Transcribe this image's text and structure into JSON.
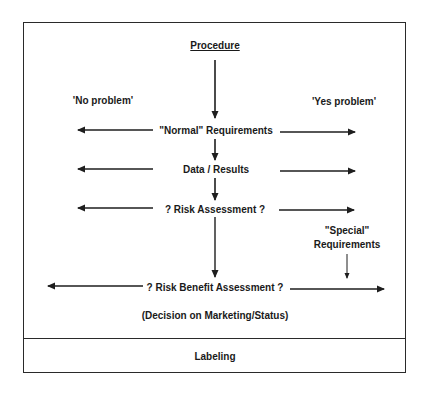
{
  "diagram": {
    "title": "Procedure",
    "side_labels": {
      "left": "'No problem'",
      "right": "'Yes problem'"
    },
    "steps": [
      {
        "label": "\"Normal\" Requirements"
      },
      {
        "label": "Data / Results"
      },
      {
        "label": "? Risk Assessment ?"
      },
      {
        "label": "? Risk Benefit Assessment ?"
      }
    ],
    "special_requirements": {
      "line1": "\"Special\"",
      "line2": "Requirements"
    },
    "decision_note": "(Decision on Marketing/Status)",
    "footer": "Labeling",
    "colors": {
      "line": "#2a2a2a",
      "text": "#1a1a1a",
      "background": "#ffffff"
    }
  }
}
